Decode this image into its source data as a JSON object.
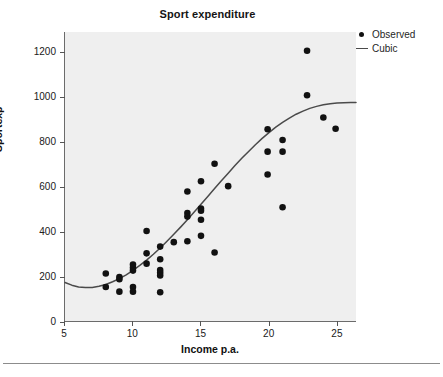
{
  "chart_data": {
    "type": "scatter",
    "title": "Sport expenditure",
    "xlabel": "Income p.a.",
    "ylabel": "Sportexp",
    "xlim": [
      5,
      26.4
    ],
    "ylim": [
      0,
      1290
    ],
    "xticks": [
      5,
      10,
      15,
      20,
      25
    ],
    "yticks": [
      0,
      200,
      400,
      600,
      800,
      1000,
      1200
    ],
    "grid": false,
    "legend_position": "top-right",
    "legend": [
      {
        "label": "Observed",
        "marker": "dot",
        "color": "#111111"
      },
      {
        "label": "Cubic",
        "marker": "line",
        "color": "#4a4a4a"
      }
    ],
    "series": [
      {
        "name": "Observed",
        "type": "scatter",
        "marker_color": "#111111",
        "points": [
          [
            8.0,
            212
          ],
          [
            8.0,
            152
          ],
          [
            9.0,
            196
          ],
          [
            9.0,
            186
          ],
          [
            9.0,
            131
          ],
          [
            10.0,
            252
          ],
          [
            10.0,
            238
          ],
          [
            10.0,
            225
          ],
          [
            10.0,
            152
          ],
          [
            10.0,
            131
          ],
          [
            11.0,
            402
          ],
          [
            11.0,
            302
          ],
          [
            11.0,
            256
          ],
          [
            12.0,
            332
          ],
          [
            12.0,
            276
          ],
          [
            12.0,
            228
          ],
          [
            12.0,
            215
          ],
          [
            12.0,
            203
          ],
          [
            12.0,
            128
          ],
          [
            13.0,
            352
          ],
          [
            14.0,
            578
          ],
          [
            14.0,
            482
          ],
          [
            14.0,
            466
          ],
          [
            14.0,
            356
          ],
          [
            15.0,
            624
          ],
          [
            15.0,
            502
          ],
          [
            15.0,
            492
          ],
          [
            15.0,
            452
          ],
          [
            15.0,
            380
          ],
          [
            16.0,
            702
          ],
          [
            16.0,
            306
          ],
          [
            17.0,
            602
          ],
          [
            19.9,
            856
          ],
          [
            19.9,
            756
          ],
          [
            19.9,
            654
          ],
          [
            21.0,
            808
          ],
          [
            21.0,
            756
          ],
          [
            21.0,
            508
          ],
          [
            22.8,
            1206
          ],
          [
            22.8,
            1008
          ],
          [
            24.0,
            908
          ],
          [
            24.9,
            858
          ]
        ]
      },
      {
        "name": "Cubic",
        "type": "line",
        "line_color": "#4a4a4a",
        "points": [
          [
            5.0,
            172
          ],
          [
            5.5,
            160
          ],
          [
            6.0,
            152
          ],
          [
            6.5,
            149
          ],
          [
            7.0,
            150
          ],
          [
            7.5,
            155
          ],
          [
            8.0,
            163
          ],
          [
            8.5,
            175
          ],
          [
            9.0,
            189
          ],
          [
            9.5,
            206
          ],
          [
            10.0,
            226
          ],
          [
            10.5,
            248
          ],
          [
            11.0,
            272
          ],
          [
            11.5,
            298
          ],
          [
            12.0,
            326
          ],
          [
            12.5,
            356
          ],
          [
            13.0,
            387
          ],
          [
            13.5,
            419
          ],
          [
            14.0,
            452
          ],
          [
            14.5,
            486
          ],
          [
            15.0,
            521
          ],
          [
            15.5,
            556
          ],
          [
            16.0,
            591
          ],
          [
            16.5,
            626
          ],
          [
            17.0,
            660
          ],
          [
            17.5,
            694
          ],
          [
            18.0,
            726
          ],
          [
            18.5,
            757
          ],
          [
            19.0,
            787
          ],
          [
            19.5,
            815
          ],
          [
            20.0,
            841
          ],
          [
            20.5,
            865
          ],
          [
            21.0,
            887
          ],
          [
            21.5,
            906
          ],
          [
            22.0,
            923
          ],
          [
            22.5,
            937
          ],
          [
            23.0,
            949
          ],
          [
            23.5,
            958
          ],
          [
            24.0,
            965
          ],
          [
            24.5,
            970
          ],
          [
            25.0,
            973
          ],
          [
            25.5,
            974
          ],
          [
            26.0,
            975
          ],
          [
            26.4,
            975
          ]
        ]
      }
    ]
  }
}
